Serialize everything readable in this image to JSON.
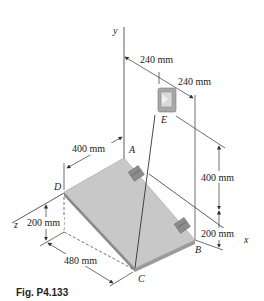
{
  "figure": {
    "caption": "Fig. P4.133",
    "axes": {
      "x": "x",
      "y": "y",
      "z": "z"
    },
    "points": {
      "A": "A",
      "B": "B",
      "C": "C",
      "D": "D",
      "E": "E"
    },
    "dimensions": {
      "top_left": "240 mm",
      "top_right": "240 mm",
      "plate_width_AD": "400 mm",
      "vertical_upper": "400 mm",
      "vertical_lower_right": "200 mm",
      "vertical_left": "200 mm",
      "plate_length_DC": "480 mm"
    },
    "colors": {
      "plate_top": "#c8c8c8",
      "plate_edge": "#8a8a8a",
      "line": "#333333",
      "hinge": "#8c8c8c"
    }
  }
}
